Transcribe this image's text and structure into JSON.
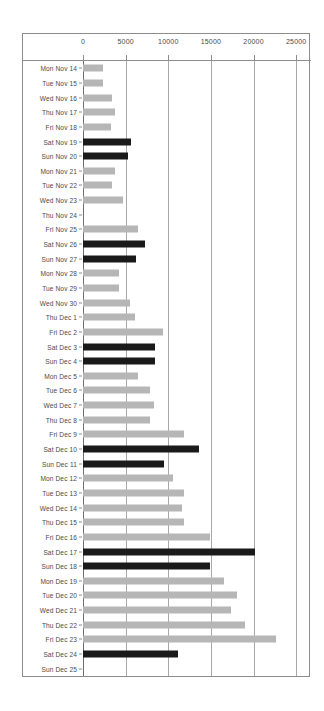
{
  "chart_data": {
    "type": "bar",
    "orientation": "horizontal",
    "title": "",
    "subtitle": "",
    "xlabel": "",
    "ylabel": "",
    "xlim": [
      0,
      26500
    ],
    "grid": true,
    "legend": "none",
    "x_ticks": [
      0,
      5000,
      10000,
      15000,
      20000,
      25000
    ],
    "x_tick_labels": [
      "0",
      "5000",
      "10000",
      "15000",
      "20000",
      "25000"
    ],
    "colors": {
      "weekday_bar": "#b6b6b6",
      "weekend_bar": "#1a1a1a",
      "gridline": "#a8a8a8",
      "frame": "#8d8d8d",
      "text": "#4a4a4a",
      "background": "#ffffff"
    },
    "categories": [
      "Mon Nov 14",
      "Tue Nov 15",
      "Wed Nov 16",
      "Thu Nov 17",
      "Fri Nov 18",
      "Sat Nov 19",
      "Sun Nov 20",
      "Mon Nov 21",
      "Tue Nov 22",
      "Wed Nov 23",
      "Thu Nov 24",
      "Fri Nov 25",
      "Sat Nov 26",
      "Sun Nov 27",
      "Mon Nov 28",
      "Tue Nov 29",
      "Wed Nov 30",
      "Thu Dec 1",
      "Fri Dec 2",
      "Sat Dec 3",
      "Sun Dec 4",
      "Mon Dec 5",
      "Tue Dec 6",
      "Wed Dec 7",
      "Thu Dec 8",
      "Fri Dec 9",
      "Sat Dec 10",
      "Sun Dec 11",
      "Mon Dec 12",
      "Tue Dec 13",
      "Wed Dec 14",
      "Thu Dec 15",
      "Fri Dec 16",
      "Sat Dec 17",
      "Sun Dec 18",
      "Mon Dec 19",
      "Tue Dec 20",
      "Wed Dec 21",
      "Thu Dec 22",
      "Fri Dec 23",
      "Sat Dec 24",
      "Sun Dec 25"
    ],
    "values": [
      2300,
      2400,
      3400,
      3700,
      3300,
      5600,
      5300,
      3800,
      3400,
      4700,
      0,
      6400,
      7300,
      6200,
      4200,
      4200,
      5500,
      6100,
      9400,
      8400,
      8400,
      6400,
      7900,
      8300,
      7800,
      11900,
      13600,
      9500,
      10500,
      11900,
      11600,
      11800,
      14900,
      20200,
      14900,
      16500,
      18000,
      17300,
      19000,
      22600,
      11100,
      0
    ],
    "highlight": [
      false,
      false,
      false,
      false,
      false,
      true,
      true,
      false,
      false,
      false,
      false,
      false,
      true,
      true,
      false,
      false,
      false,
      false,
      false,
      true,
      true,
      false,
      false,
      false,
      false,
      false,
      true,
      true,
      false,
      false,
      false,
      false,
      false,
      true,
      true,
      false,
      false,
      false,
      false,
      false,
      true,
      true
    ]
  }
}
